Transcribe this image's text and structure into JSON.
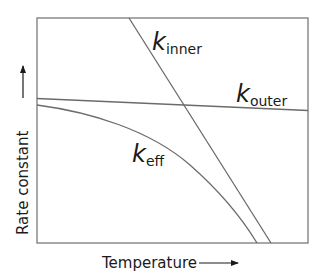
{
  "diagram": {
    "type": "rate-constant-vs-temperature",
    "x_axis_label": "Temperature",
    "y_axis_label": "Rate constant",
    "curves": [
      {
        "id": "inner",
        "symbol": "k",
        "subscript": "inner",
        "shape": "straight line, steeply decreasing"
      },
      {
        "id": "outer",
        "symbol": "k",
        "subscript": "outer",
        "shape": "straight line, slightly decreasing"
      },
      {
        "id": "eff",
        "symbol": "k",
        "subscript": "eff",
        "shape": "curve, decreasing with increasing slope"
      }
    ],
    "line_color": "#6b6b6b",
    "frame_color": "#7a7a7a"
  },
  "labels": {
    "k_inner": {
      "main": "k",
      "sub": "inner"
    },
    "k_outer": {
      "main": "k",
      "sub": "outer"
    },
    "k_eff": {
      "main": "k",
      "sub": "eff"
    },
    "x_axis": "Temperature",
    "y_axis": "Rate constant"
  }
}
